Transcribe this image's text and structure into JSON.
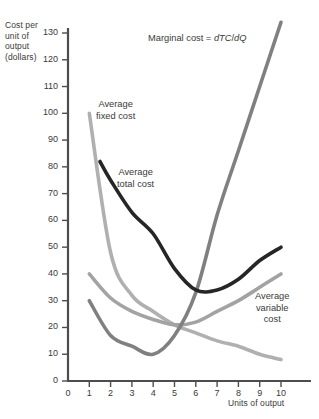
{
  "chart_data": {
    "type": "line",
    "title": "",
    "xlabel": "Units of output",
    "ylabel": "Cost per unit of output (dollars)",
    "ylabel_lines": [
      "Cost per",
      "unit of",
      "output",
      "(dollars)"
    ],
    "xlim": [
      0,
      10.6
    ],
    "ylim": [
      0,
      133
    ],
    "xticks": [
      0,
      1,
      2,
      3,
      4,
      5,
      6,
      7,
      8,
      9,
      10
    ],
    "yticks": [
      0,
      10,
      20,
      30,
      40,
      50,
      60,
      70,
      80,
      90,
      100,
      110,
      120,
      130
    ],
    "grid": false,
    "legend_position": "inline-annotations",
    "series": [
      {
        "name": "Marginal cost",
        "label_lines": [
          "Marginal cost = dTC/dQ"
        ],
        "label_plain": "Marginal cost = dTC/dQ",
        "label_math": "dTC/dQ",
        "color": "#808080",
        "width": 3.6,
        "x": [
          1,
          2,
          3,
          4,
          5,
          6,
          7,
          8,
          9,
          10
        ],
        "values": [
          30,
          17,
          13,
          10,
          17,
          33,
          62,
          86,
          110,
          134
        ]
      },
      {
        "name": "Average fixed cost",
        "label_lines": [
          "Average",
          "fixed cost"
        ],
        "color": "#b0b0b0",
        "width": 3.6,
        "x": [
          1,
          2,
          3,
          4,
          5,
          6,
          7,
          8,
          9,
          10
        ],
        "values": [
          100,
          48,
          32,
          26,
          21,
          18,
          15,
          13,
          10,
          8
        ]
      },
      {
        "name": "Average total cost",
        "label_lines": [
          "Average",
          "total cost"
        ],
        "color": "#262626",
        "width": 3.6,
        "x": [
          1.5,
          2,
          3,
          4,
          5,
          6,
          7,
          8,
          9,
          10
        ],
        "values": [
          82,
          75,
          63,
          55,
          42,
          34,
          34,
          38,
          45,
          50
        ]
      },
      {
        "name": "Average variable cost",
        "label_lines": [
          "Average",
          "variable",
          "cost"
        ],
        "color": "#a3a3a3",
        "width": 3.6,
        "x": [
          1,
          2,
          3,
          4,
          5,
          6,
          7,
          8,
          9,
          10
        ],
        "values": [
          40,
          31,
          26,
          23,
          21,
          22,
          26,
          30,
          35,
          40
        ]
      }
    ]
  },
  "axes": {
    "y_title_lines": [
      "Cost per",
      "unit of",
      "output",
      "(dollars)"
    ],
    "x_title": "Units of output"
  },
  "colors": {
    "axis": "#4d4d4d",
    "text": "#3a3a3a",
    "marginal_cost": "#808080",
    "average_fixed_cost": "#b0b0b0",
    "average_total_cost": "#262626",
    "average_variable_cost": "#a3a3a3",
    "background": "#ffffff"
  }
}
